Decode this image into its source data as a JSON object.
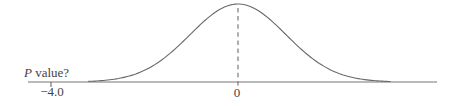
{
  "colors": {
    "curve": "#686868",
    "axis": "#a3a3a3",
    "dashed_line": "#7a7a7a",
    "text": "#444444",
    "background": "#ffffff"
  },
  "chart_data": {
    "type": "line",
    "title": "",
    "xlabel": "",
    "ylabel": "",
    "grid": false,
    "curve": {
      "distribution": "normal",
      "mean": 0,
      "sd": 1
    },
    "dashed_line_at_x": 0,
    "x_ticks": [
      {
        "value": -4.0,
        "label": "−4.0"
      },
      {
        "value": 0,
        "label": "0"
      }
    ],
    "annotations": [
      {
        "text": "P value?",
        "near_x": -4.0,
        "position": "above-axis-left"
      }
    ],
    "xlim": [
      -4.5,
      4.3
    ]
  }
}
